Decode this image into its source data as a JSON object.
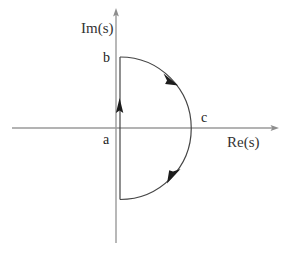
{
  "figure": {
    "width": 289,
    "height": 256,
    "background": "#ffffff"
  },
  "axes": {
    "imaginary": {
      "label": "Im(s)",
      "icon": "arrow-up-icon",
      "color": "#9a9a9a",
      "x": 116,
      "y_top": 9,
      "y_bottom": 243
    },
    "real": {
      "label": "Re(s)",
      "icon": "arrow-right-icon",
      "color": "#9a9a9a",
      "y": 128,
      "x_left": 12,
      "x_right": 278
    }
  },
  "contour": {
    "color": "#404040",
    "stroke_width": 1.1,
    "vertical_segment": {
      "x": 120,
      "y_start": 199,
      "y_end": 57,
      "direction": "upward",
      "arrow_icon": "arrow-up-icon",
      "arrow_x": 119,
      "arrow_y": 104
    },
    "arc": {
      "center_x": 120,
      "center_y": 128,
      "radius": 71,
      "sweep": "clockwise-right-half",
      "from": "b",
      "to": "a",
      "arrow_icons": [
        "arrow-clockwise-upper-icon",
        "arrow-clockwise-lower-icon"
      ],
      "arrow_upper": {
        "x": 172,
        "y": 79
      },
      "arrow_lower": {
        "x": 174,
        "y": 176
      }
    }
  },
  "labels": {
    "a": "a",
    "b": "b",
    "c": "c",
    "im_axis": "Im(s)",
    "re_axis": "Re(s)"
  },
  "points": [
    {
      "name": "a",
      "label": "a",
      "x": 120,
      "y": 128,
      "description": "contour start on real axis"
    },
    {
      "name": "b",
      "label": "b",
      "x": 120,
      "y": 57,
      "description": "top of vertical segment"
    },
    {
      "name": "c",
      "label": "c",
      "x": 191,
      "y": 128,
      "description": "rightmost point of arc"
    }
  ],
  "colors": {
    "axis": "#9a9a9a",
    "contour": "#404040",
    "text": "#222222",
    "background": "#ffffff"
  }
}
